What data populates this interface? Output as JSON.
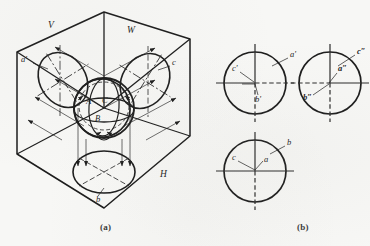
{
  "figure": {
    "title_a": "(a)",
    "title_b": "(b)",
    "background_color": "#f7f7f5",
    "line_color": "#1d1d1d",
    "thin_line_color": "#3a3a3a",
    "center_line_color": "#2a2a2a"
  },
  "panel_a": {
    "caption": "(a)",
    "description": "isometric three-plane projection box with sphere and projected ellipses",
    "plane_labels": [
      {
        "id": "V",
        "text": "V",
        "x": 48,
        "y": 28
      },
      {
        "id": "W",
        "text": "W",
        "x": 127,
        "y": 33
      },
      {
        "id": "H",
        "text": "H",
        "x": 160,
        "y": 177
      }
    ],
    "point_labels": [
      {
        "id": "a-prime",
        "text": "a'",
        "x": 24,
        "y": 62
      },
      {
        "id": "c",
        "text": "c",
        "x": 172,
        "y": 65
      },
      {
        "id": "b",
        "text": "b",
        "x": 99,
        "y": 199
      },
      {
        "id": "A",
        "text": "A",
        "x": 89,
        "y": 102
      },
      {
        "id": "C",
        "text": "C",
        "x": 104,
        "y": 101
      },
      {
        "id": "B",
        "text": "B",
        "x": 97,
        "y": 118
      }
    ],
    "hexagon_vertices": [
      [
        104,
        12
      ],
      [
        190,
        39
      ],
      [
        190,
        136
      ],
      [
        104,
        208
      ],
      [
        17,
        154
      ],
      [
        17,
        52
      ]
    ],
    "center_point": [
      104,
      108
    ]
  },
  "panel_b": {
    "caption": "(b)",
    "description": "three orthographic views: front (V), side (W) and top (H) projections of the sphere",
    "views": [
      {
        "name": "front-view",
        "cx": 255,
        "cy": 83,
        "r": 31,
        "labels": [
          {
            "id": "a-prime",
            "text": "a'",
            "x": 291,
            "y": 56
          },
          {
            "id": "c-prime",
            "text": "c'",
            "x": 236,
            "y": 70
          },
          {
            "id": "b-prime",
            "text": "b'",
            "x": 261,
            "y": 99
          }
        ]
      },
      {
        "name": "side-view",
        "cx": 330,
        "cy": 83,
        "r": 31,
        "labels": [
          {
            "id": "c-double-prime",
            "text": "c″",
            "x": 358,
            "y": 53
          },
          {
            "id": "a-double-prime",
            "text": "a″",
            "x": 339,
            "y": 75
          },
          {
            "id": "b-double-prime",
            "text": "b″",
            "x": 309,
            "y": 98
          }
        ]
      },
      {
        "name": "top-view",
        "cx": 255,
        "cy": 171,
        "r": 31,
        "labels": [
          {
            "id": "b",
            "text": "b",
            "x": 288,
            "y": 143
          },
          {
            "id": "c",
            "text": "c",
            "x": 234,
            "y": 159
          },
          {
            "id": "a",
            "text": "a",
            "x": 265,
            "y": 163
          }
        ]
      }
    ]
  }
}
